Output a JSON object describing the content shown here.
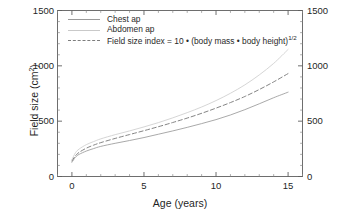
{
  "chart_data": {
    "type": "line",
    "title": "",
    "xlabel": "Age (years)",
    "ylabel": "Field size (cm2)",
    "ylabel_unit_base": "Field size (cm",
    "ylabel_unit_sup": "2",
    "ylabel_unit_close": ")",
    "xlim": [
      -1,
      16
    ],
    "ylim": [
      0,
      1500
    ],
    "grid": false,
    "legend_position": "top-left-inside",
    "y_ticks": [
      0,
      500,
      1000,
      1500
    ],
    "y_ticks_right": [
      0,
      500,
      1000,
      1500
    ],
    "x_ticks": [
      0,
      5,
      10,
      15
    ],
    "y_minor_step": 100,
    "x_minor_step": 1,
    "x": [
      0,
      0.25,
      0.5,
      1,
      1.5,
      2,
      3,
      4,
      5,
      6,
      7,
      8,
      9,
      10,
      11,
      12,
      13,
      14,
      15
    ],
    "series": [
      {
        "name": "Chest ap",
        "style": "solid",
        "color": "#9a9a9a",
        "values": [
          128,
          175,
          200,
          230,
          252,
          272,
          300,
          325,
          352,
          382,
          412,
          444,
          478,
          514,
          556,
          604,
          657,
          712,
          762
        ]
      },
      {
        "name": "Abdomen ap",
        "style": "solid",
        "color": "#cdcdcd",
        "values": [
          152,
          215,
          248,
          288,
          315,
          340,
          378,
          412,
          448,
          487,
          530,
          577,
          628,
          686,
          752,
          828,
          918,
          1022,
          1148
        ]
      },
      {
        "name": "Field size index = 10 • (body mass • body height)1/2",
        "style": "dashed",
        "color": "#7d7d7d",
        "values": [
          140,
          188,
          218,
          256,
          283,
          306,
          344,
          379,
          414,
          450,
          488,
          528,
          571,
          618,
          668,
          723,
          786,
          855,
          930
        ]
      }
    ]
  },
  "legend": {
    "items": [
      {
        "label": "Chest ap",
        "key": "solid-line-key",
        "sup": ""
      },
      {
        "label": "Abdomen ap",
        "key": "solid-line-key",
        "sup": ""
      },
      {
        "label": "Field size index = 10 • (body mass • body height)",
        "key": "dashed-line-key",
        "sup": "1/2"
      }
    ]
  },
  "axes": {
    "x_title": "Age (years)",
    "y_title_base": "Field size (cm",
    "y_title_sup": "2",
    "y_title_close": ")",
    "x_tick_labels": [
      "0",
      "5",
      "10",
      "15"
    ],
    "y_tick_labels": [
      "0",
      "500",
      "1000",
      "1500"
    ],
    "y_tick_labels_right": [
      "0",
      "500",
      "1000",
      "1500"
    ]
  },
  "caption_fragment": "",
  "colors": {
    "frame": "#6e6e6e",
    "chest": "#9a9a9a",
    "abdomen": "#cdcdcd",
    "index": "#7d7d7d",
    "text": "#1f1f1f",
    "background": "#ffffff"
  }
}
